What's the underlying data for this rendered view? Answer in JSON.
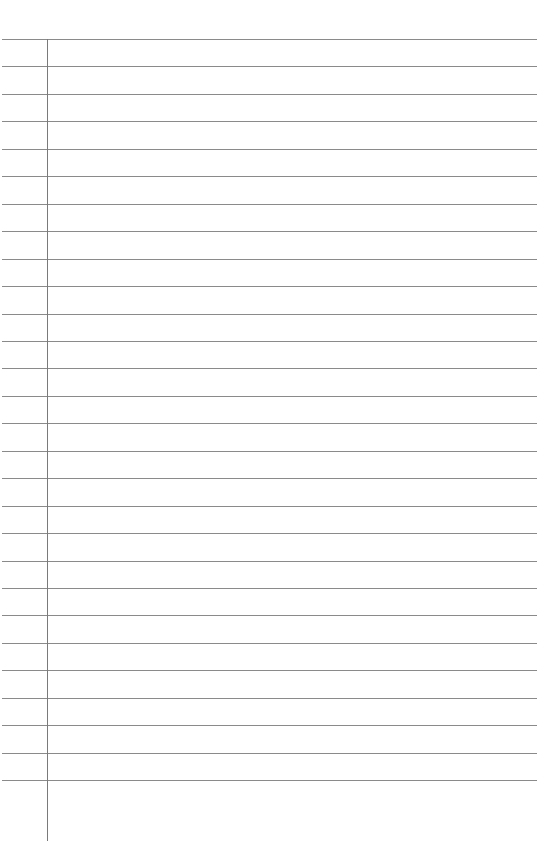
{
  "page": {
    "type": "ruled-notebook-page",
    "background_color": "#ffffff",
    "rule_color": "#8a8a8a",
    "margin_color": "#7a7a7a",
    "rule_count": 28,
    "first_rule_y": 39,
    "rule_spacing": 27.45,
    "margin_x": 47,
    "lines": []
  }
}
